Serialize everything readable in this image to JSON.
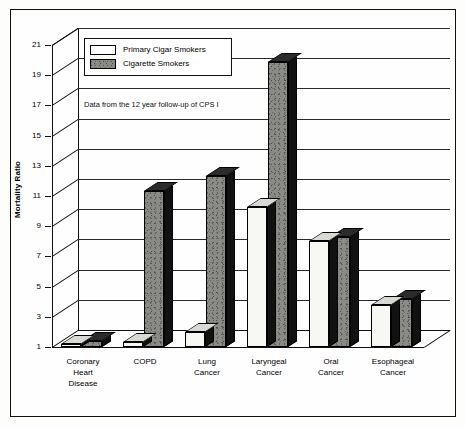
{
  "chart_data": {
    "type": "bar",
    "title": "",
    "xlabel": "",
    "ylabel": "Mortality Ratio",
    "ylim": [
      1,
      21
    ],
    "ytick_labels": [
      "1",
      "3",
      "5",
      "7",
      "9",
      "11",
      "13",
      "15",
      "17",
      "19",
      "21"
    ],
    "ytick_values": [
      1,
      3,
      5,
      7,
      9,
      11,
      13,
      15,
      17,
      19,
      21
    ],
    "grid": true,
    "legend_position": "top-left",
    "annotation": "Data from the 12 year follow-up of CPS I",
    "categories": [
      "Coronary\nHeart\nDisease",
      "COPD",
      "Lung\nCancer",
      "Laryngeal\nCancer",
      "Oral\nCancer",
      "Esophageal\nCancer"
    ],
    "series": [
      {
        "name": "Primary Cigar Smokers",
        "color": "#f7f7f4",
        "values": [
          1.2,
          1.3,
          2.0,
          10.3,
          8.0,
          3.8
        ]
      },
      {
        "name": "Cigarette Smokers",
        "color": "#8a8a86",
        "values": [
          1.4,
          11.3,
          12.3,
          19.9,
          8.3,
          4.2
        ]
      }
    ]
  },
  "legend": {
    "items": [
      {
        "label": "Primary Cigar Smokers",
        "swatch": "white"
      },
      {
        "label": "Cigarette Smokers",
        "swatch": "grey"
      }
    ]
  }
}
